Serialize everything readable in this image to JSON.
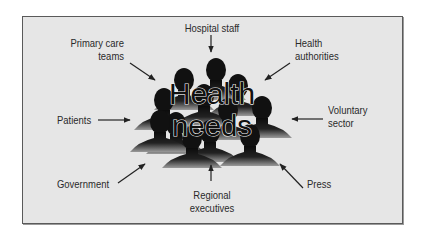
{
  "diagram": {
    "center": {
      "line1": "Health",
      "line2": "needs",
      "icon": "crowd-silhouette-icon"
    },
    "stakeholders": [
      {
        "id": "hospital-staff",
        "lines": [
          "Hospital staff"
        ],
        "arrow_direction": "down"
      },
      {
        "id": "primary-care-teams",
        "lines": [
          "Primary care",
          "teams"
        ],
        "arrow_direction": "down-right"
      },
      {
        "id": "health-authorities",
        "lines": [
          "Health",
          "authorities"
        ],
        "arrow_direction": "down-left"
      },
      {
        "id": "patients",
        "lines": [
          "Patients"
        ],
        "arrow_direction": "right"
      },
      {
        "id": "voluntary-sector",
        "lines": [
          "Voluntary",
          "sector"
        ],
        "arrow_direction": "left"
      },
      {
        "id": "government",
        "lines": [
          "Government"
        ],
        "arrow_direction": "up-right"
      },
      {
        "id": "press",
        "lines": [
          "Press"
        ],
        "arrow_direction": "up-left"
      },
      {
        "id": "regional-executives",
        "lines": [
          "Regional",
          "executives"
        ],
        "arrow_direction": "up"
      }
    ],
    "colors": {
      "background": "#e6e6e6",
      "border": "#5a5a5a",
      "silhouette": "#111111",
      "text": "#2a2a2a"
    }
  }
}
